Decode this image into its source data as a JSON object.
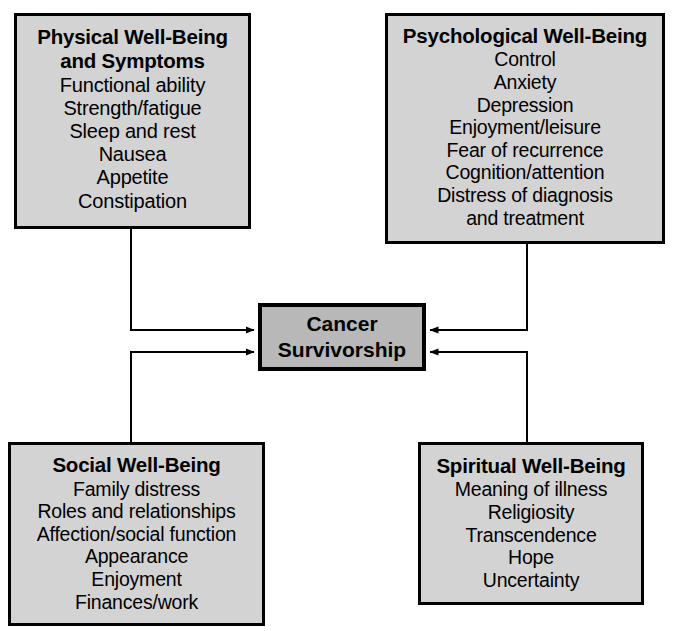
{
  "diagram": {
    "colors": {
      "node_fill": "#d3d3d3",
      "center_fill": "#b8b8b8",
      "border": "#000000",
      "background": "#ffffff",
      "connector": "#000000"
    }
  },
  "center": {
    "label_line1": "Cancer",
    "label_line2": "Survivorship"
  },
  "nodes": [
    {
      "id": "physical",
      "title_line1": "Physical Well-Being",
      "title_line2": "and Symptoms",
      "items": [
        "Functional ability",
        "Strength/fatigue",
        "Sleep and rest",
        "Nausea",
        "Appetite",
        "Constipation"
      ]
    },
    {
      "id": "psychological",
      "title_line1": "Psychological Well-Being",
      "items": [
        "Control",
        "Anxiety",
        "Depression",
        "Enjoyment/leisure",
        "Fear of recurrence",
        "Cognition/attention",
        "Distress of diagnosis",
        "and treatment"
      ]
    },
    {
      "id": "social",
      "title_line1": "Social Well-Being",
      "items": [
        "Family distress",
        "Roles and relationships",
        "Affection/social function",
        "Appearance",
        "Enjoyment",
        "Finances/work"
      ]
    },
    {
      "id": "spiritual",
      "title_line1": "Spiritual Well-Being",
      "items": [
        "Meaning of illness",
        "Religiosity",
        "Transcendence",
        "Hope",
        "Uncertainty"
      ]
    }
  ],
  "connectors": [
    {
      "from": "physical",
      "to": "center",
      "direction": "to-center",
      "enters": "left-upper"
    },
    {
      "from": "psychological",
      "to": "center",
      "direction": "to-center",
      "enters": "right-upper"
    },
    {
      "from": "social",
      "to": "center",
      "direction": "to-center",
      "enters": "left-lower"
    },
    {
      "from": "spiritual",
      "to": "center",
      "direction": "to-center",
      "enters": "right-lower"
    }
  ]
}
